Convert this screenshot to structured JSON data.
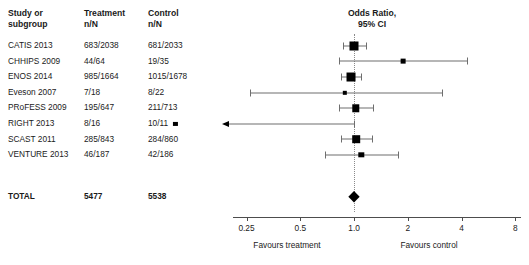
{
  "table": {
    "headers": [
      "Study or\nsubgroup",
      "Treatment\nn/N",
      "Control\nn/N"
    ],
    "rows": [
      {
        "study": "CATIS 2013",
        "treatment": "683/2038",
        "control": "681/2033"
      },
      {
        "study": "CHHIPS 2009",
        "treatment": "44/64",
        "control": "19/35"
      },
      {
        "study": "ENOS 2014",
        "treatment": "985/1664",
        "control": "1015/1678"
      },
      {
        "study": "Eveson 2007",
        "treatment": "7/18",
        "control": "8/22"
      },
      {
        "study": "PRoFESS 2009",
        "treatment": "195/647",
        "control": "211/713"
      },
      {
        "study": "RIGHT 2013",
        "treatment": "8/16",
        "control": "10/11"
      },
      {
        "study": "SCAST 2011",
        "treatment": "285/843",
        "control": "284/860"
      },
      {
        "study": "VENTURE 2013",
        "treatment": "46/187",
        "control": "42/186"
      }
    ],
    "total": {
      "study": "TOTAL",
      "treatment": "5477",
      "control": "5538"
    }
  },
  "chart_data": {
    "type": "forest",
    "title": "Odds Ratio,\n95% CI",
    "xlabel": "",
    "ylabel": "",
    "xscale": "log",
    "xlim": [
      0.21,
      8.6
    ],
    "ticks": [
      0.25,
      0.5,
      1.0,
      2,
      4,
      8
    ],
    "tick_labels": [
      "0.25",
      "0.5",
      "1.0",
      "2",
      "4",
      "8"
    ],
    "null_value": 1.0,
    "grid": false,
    "legend": "none",
    "favours_left": "Favours treatment",
    "favours_right": "Favours control",
    "studies": [
      {
        "label": "CATIS 2013",
        "or": 1.0,
        "ci_low": 0.87,
        "ci_high": 1.16,
        "weight": 27.0,
        "clipped_left": false,
        "clipped_right": false
      },
      {
        "label": "CHHIPS 2009",
        "or": 1.88,
        "ci_low": 0.82,
        "ci_high": 4.3,
        "weight": 3.0,
        "clipped_left": false,
        "clipped_right": false
      },
      {
        "label": "ENOS 2014",
        "or": 0.96,
        "ci_low": 0.84,
        "ci_high": 1.1,
        "weight": 26.0,
        "clipped_left": false,
        "clipped_right": false
      },
      {
        "label": "Eveson 2007",
        "or": 0.89,
        "ci_low": 0.26,
        "ci_high": 3.1,
        "weight": 2.0,
        "clipped_left": false,
        "clipped_right": false
      },
      {
        "label": "PRoFESS 2009",
        "or": 1.02,
        "ci_low": 0.82,
        "ci_high": 1.27,
        "weight": 15.0,
        "clipped_left": false,
        "clipped_right": false
      },
      {
        "label": "RIGHT 2013",
        "or": 0.1,
        "ci_low": 0.02,
        "ci_high": 1.0,
        "weight": 1.5,
        "clipped_left": true,
        "clipped_right": false
      },
      {
        "label": "SCAST 2011",
        "or": 1.03,
        "ci_low": 0.85,
        "ci_high": 1.26,
        "weight": 16.0,
        "clipped_left": false,
        "clipped_right": false
      },
      {
        "label": "VENTURE 2013",
        "or": 1.1,
        "ci_low": 0.69,
        "ci_high": 1.76,
        "weight": 5.0,
        "clipped_left": false,
        "clipped_right": false
      }
    ],
    "pooled": {
      "label": "TOTAL",
      "or": 1.0,
      "ci_low": 0.93,
      "ci_high": 1.08
    }
  }
}
